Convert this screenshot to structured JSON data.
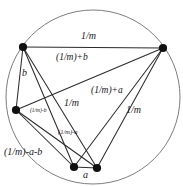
{
  "figure": {
    "name": "complete-graph-on-circle",
    "colors": {
      "stroke": "#2b2b2b",
      "circle_stroke": "#7a7a7a",
      "vertex_fill": "#111111",
      "background": "#ffffff",
      "text": "#16161a"
    },
    "circle": {
      "cx": 93,
      "cy": 97,
      "r": 87
    },
    "vertices": [
      {
        "id": "v1",
        "name": "vertex-top-left",
        "x": 23,
        "y": 47
      },
      {
        "id": "v2",
        "name": "vertex-top-right",
        "x": 163,
        "y": 48
      },
      {
        "id": "v3",
        "name": "vertex-left",
        "x": 16,
        "y": 110
      },
      {
        "id": "v4",
        "name": "vertex-bottom-left",
        "x": 74,
        "y": 167
      },
      {
        "id": "v5",
        "name": "vertex-bottom-right",
        "x": 97,
        "y": 168
      }
    ],
    "edges": [
      {
        "from": "v1",
        "to": "v2",
        "label": "1/m"
      },
      {
        "from": "v1",
        "to": "v3",
        "label": "b"
      },
      {
        "from": "v1",
        "to": "v4",
        "label": ""
      },
      {
        "from": "v1",
        "to": "v5",
        "label": "1/m"
      },
      {
        "from": "v2",
        "to": "v3",
        "label": "(1/m)+b"
      },
      {
        "from": "v2",
        "to": "v4",
        "label": "(1/m)+a"
      },
      {
        "from": "v2",
        "to": "v5",
        "label": "1/m"
      },
      {
        "from": "v3",
        "to": "v4",
        "label": "(1/m)-b"
      },
      {
        "from": "v3",
        "to": "v5",
        "label": "(1/m)-a-b"
      },
      {
        "from": "v4",
        "to": "v5",
        "label": "a"
      }
    ],
    "labels": [
      {
        "key": "top_chord",
        "name": "label-1-over-m-top",
        "text": "1/m",
        "x": 81,
        "y": 38,
        "size": "md",
        "rotate": "none"
      },
      {
        "key": "upper_mid",
        "name": "label-1-over-m-plus-b",
        "text": "(1/m)+b",
        "x": 56,
        "y": 58,
        "size": "sm",
        "rotate": "none"
      },
      {
        "key": "left_b",
        "name": "label-b",
        "text": "b",
        "x": 22,
        "y": 73,
        "size": "md",
        "rotate": "none"
      },
      {
        "key": "right_mid",
        "name": "label-1-over-m-plus-a",
        "text": "(1/m)+a",
        "x": 91,
        "y": 91,
        "size": "sm",
        "rotate": "none"
      },
      {
        "key": "center_chord",
        "name": "label-1-over-m-center",
        "text": "1/m",
        "x": 64,
        "y": 103,
        "size": "md",
        "rotate": "none"
      },
      {
        "key": "right_chord",
        "name": "label-1-over-m-right",
        "text": "1/m",
        "x": 126,
        "y": 110,
        "size": "md",
        "rotate": "none"
      },
      {
        "key": "small_minus_b",
        "name": "label-1-over-m-minus-b",
        "text": "(1/m)-b",
        "x": 30,
        "y": 112,
        "size": "xs",
        "rotate": "none"
      },
      {
        "key": "small_minus_a",
        "name": "label-1-over-m-minus-a",
        "text": "(1/m)-a",
        "x": 58,
        "y": 133,
        "size": "tiny",
        "rotate": "none"
      },
      {
        "key": "lower_left",
        "name": "label-1-over-m-minus-a-b",
        "text": "(1/m)-a-b",
        "x": 4,
        "y": 152,
        "size": "md",
        "rotate": "none"
      },
      {
        "key": "bottom_a",
        "name": "label-a",
        "text": "a",
        "x": 83,
        "y": 174,
        "size": "md",
        "rotate": "none"
      }
    ]
  }
}
